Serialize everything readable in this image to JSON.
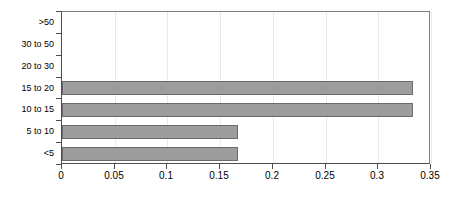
{
  "chart_data": {
    "type": "bar",
    "orientation": "horizontal",
    "title": "",
    "subtitle": "",
    "xlabel": "",
    "ylabel": "",
    "categories": [
      "<5",
      "5 to 10",
      "10 to 15",
      "15 to 20",
      "20 to 30",
      "30 to 50",
      ">50"
    ],
    "values": [
      0.167,
      0.167,
      0.333,
      0.333,
      0,
      0,
      0
    ],
    "xlim": [
      0,
      0.35
    ],
    "xticks": [
      0,
      0.05,
      0.1,
      0.15,
      0.2,
      0.25,
      0.3,
      0.35
    ],
    "xtick_labels": [
      "0",
      "0.05",
      "0.1",
      "0.15",
      "0.2",
      "0.25",
      "0.3",
      "0.35"
    ],
    "grid": "vertical",
    "legend": "none",
    "series": [
      {
        "name": "",
        "values": [
          0.167,
          0.167,
          0.333,
          0.333,
          0,
          0,
          0
        ]
      }
    ],
    "colors": {
      "bar_fill": "#9d9d9d",
      "bar_border": "#6b6b6b",
      "gridline": "#e8e8e8",
      "axis": "#4d4d4d",
      "plot_border": "#808080",
      "background": "#ffffff",
      "text": "#000000"
    }
  }
}
